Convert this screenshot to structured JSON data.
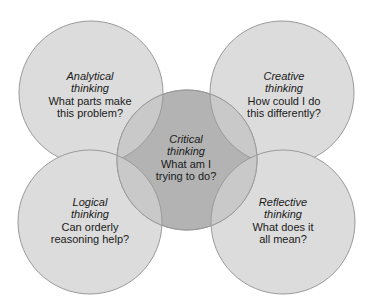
{
  "diagram": {
    "type": "venn-overlap",
    "colors": {
      "outer_fill": "#dcdcdc",
      "center_fill": "#b3b3b3",
      "overlap_fill": "#c9c9c9",
      "stroke": "#9a9a9a",
      "text": "#1a1a1a"
    },
    "circles": [
      {
        "id": "analytical",
        "title": "Analytical",
        "title2": "thinking",
        "question1": "What parts make",
        "question2": "this problem?",
        "cx": 91,
        "cy": 93,
        "r": 72
      },
      {
        "id": "creative",
        "title": "Creative",
        "title2": "thinking",
        "question1": "How could I do",
        "question2": "this differently?",
        "cx": 282,
        "cy": 93,
        "r": 72
      },
      {
        "id": "logical",
        "title": "Logical",
        "title2": "thinking",
        "question1": "Can orderly",
        "question2": "reasoning help?",
        "cx": 90,
        "cy": 222,
        "r": 72
      },
      {
        "id": "reflective",
        "title": "Reflective",
        "title2": "thinking",
        "question1": "What does it",
        "question2": "all mean?",
        "cx": 283,
        "cy": 222,
        "r": 72
      },
      {
        "id": "critical",
        "title": "Critical",
        "title2": "thinking",
        "question1": "What am I",
        "question2": "trying to do?",
        "cx": 187,
        "cy": 160,
        "r": 70
      }
    ]
  }
}
